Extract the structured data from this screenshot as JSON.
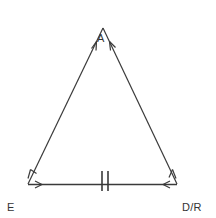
{
  "figure": {
    "type": "geometry-diagram",
    "shape": "isosceles-triangle",
    "background_color": "#ffffff",
    "stroke_color": "#3a3a3a",
    "text_color": "#333333",
    "vertices": {
      "apex": {
        "label": "A",
        "x": 103,
        "y": 28
      },
      "bottom_left": {
        "label_line_1": "E",
        "label_line_2": "O",
        "x": 28,
        "y": 184
      },
      "bottom_right": {
        "label_line_1": "D/R",
        "label_line_2": "DO",
        "x": 177,
        "y": 184
      }
    },
    "annotations": {
      "base_tick_marks": 2,
      "base_tick_x_positions": [
        102,
        108
      ],
      "leg_arrowheads": "pointing-toward-apex",
      "base_arrowheads": "pointing-inward-both-ends"
    }
  }
}
